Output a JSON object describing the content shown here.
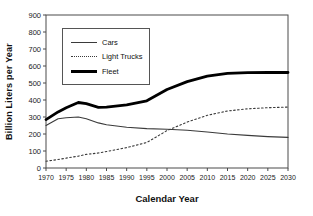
{
  "chart_data": {
    "type": "line",
    "title": "",
    "xlabel": "Calendar Year",
    "ylabel": "Billion Liters per Year",
    "xlim": [
      1970,
      2030
    ],
    "ylim": [
      0,
      900
    ],
    "x_tick_step": 5,
    "y_tick_step": 100,
    "grid": false,
    "legend_position": "top-left-inside",
    "x": [
      1970,
      1973,
      1975,
      1978,
      1980,
      1983,
      1985,
      1990,
      1995,
      2000,
      2005,
      2010,
      2015,
      2020,
      2025,
      2030
    ],
    "series": [
      {
        "name": "Cars",
        "style": "thin-solid",
        "color": "#3a3a3a",
        "values": [
          250,
          290,
          295,
          300,
          290,
          265,
          255,
          240,
          232,
          228,
          222,
          212,
          200,
          192,
          185,
          180
        ]
      },
      {
        "name": "Light Trucks",
        "style": "dotted",
        "color": "#3a3a3a",
        "values": [
          40,
          50,
          58,
          70,
          80,
          88,
          97,
          120,
          150,
          220,
          270,
          310,
          335,
          348,
          355,
          358
        ]
      },
      {
        "name": "Fleet",
        "style": "thick-solid",
        "color": "#000000",
        "values": [
          285,
          330,
          355,
          385,
          378,
          357,
          358,
          372,
          395,
          462,
          508,
          540,
          557,
          561,
          562,
          562
        ]
      }
    ]
  },
  "colors": {
    "axis": "#4a4a4a",
    "text": "#1a1a1a",
    "background": "#ffffff",
    "legend_border": "#555555"
  }
}
